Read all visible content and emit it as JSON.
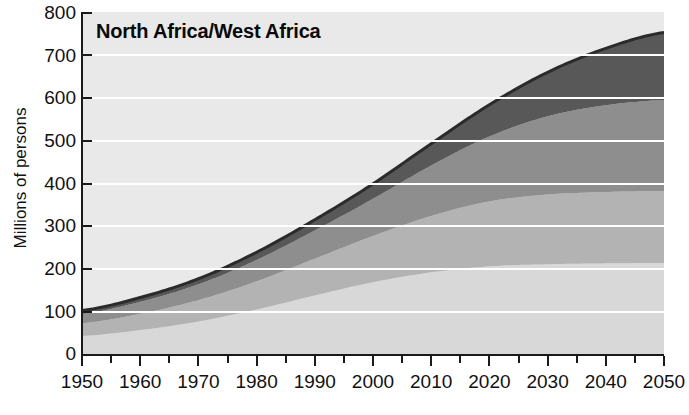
{
  "chart_data": {
    "type": "area",
    "title": "North Africa/West Africa",
    "xlabel": "",
    "ylabel": "Millions of persons",
    "xlim": [
      1950,
      2050
    ],
    "ylim": [
      0,
      800
    ],
    "ytick_step": 100,
    "xtick_step": 10,
    "grid": true,
    "stacked": true,
    "legend": "none",
    "x": [
      1950,
      1960,
      1970,
      1980,
      1990,
      2000,
      2010,
      2020,
      2030,
      2040,
      2050
    ],
    "series": [
      {
        "name": "band-1-bottom",
        "color": "#d8d8d8",
        "values": [
          42,
          56,
          76,
          104,
          137,
          168,
          191,
          205,
          210,
          212,
          213
        ]
      },
      {
        "name": "band-2",
        "color": "#b3b3b3",
        "values": [
          30,
          38,
          50,
          66,
          86,
          108,
          132,
          152,
          163,
          167,
          168
        ]
      },
      {
        "name": "band-3",
        "color": "#8e8e8e",
        "values": [
          22,
          28,
          37,
          50,
          66,
          87,
          118,
          152,
          183,
          203,
          213
        ]
      },
      {
        "name": "band-4-top",
        "color": "#585858",
        "values": [
          8,
          10,
          13,
          18,
          25,
          35,
          51,
          74,
          103,
          133,
          158
        ]
      }
    ],
    "totals": [
      102,
      132,
      176,
      238,
      314,
      398,
      492,
      583,
      659,
      715,
      752
    ],
    "yticks": [
      "800",
      "700",
      "600",
      "500",
      "400",
      "300",
      "200",
      "100",
      "0"
    ],
    "xticks": [
      "1950",
      "1960",
      "1970",
      "1980",
      "1990",
      "2000",
      "2010",
      "2020",
      "2030",
      "2040",
      "2050"
    ],
    "plot_background": "#e9e9e9",
    "gridline_color": "#ffffff",
    "axis_color": "#1a1a1a"
  }
}
